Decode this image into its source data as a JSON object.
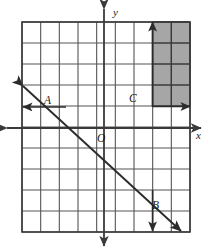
{
  "figure": {
    "background_color": "#ffffff",
    "width": 210,
    "height": 251
  },
  "grid": {
    "columns": 9,
    "rows": 10,
    "left": 22,
    "top": 22,
    "right": 190,
    "bottom": 232,
    "cell_width": 18.67,
    "cell_height": 21,
    "line_color": "#555555",
    "line_width": 1.1,
    "border_color": "#3a3a3a",
    "border_width": 1.6
  },
  "axes": {
    "color": "#3a3a3a",
    "width": 1.8,
    "x_axis": {
      "label": "x",
      "label_x": 196,
      "label_y": 139,
      "y": 128,
      "from_x": 7,
      "to_x": 201,
      "arrow_start": true,
      "arrow_end": true
    },
    "y_axis": {
      "label": "y",
      "label_x": 113,
      "label_y": 16,
      "x": 104,
      "from_y": 9,
      "to_y": 246,
      "arrow_start": true,
      "arrow_end": true
    },
    "origin": {
      "label": "O",
      "label_x": 97,
      "label_y": 142,
      "x": 104,
      "y": 128
    }
  },
  "line": {
    "name": "line-AB",
    "color": "#2b2b2b",
    "width": 1.9,
    "x1": 23,
    "y1": 86,
    "x2": 181,
    "y2": 231,
    "arrow_start": true,
    "arrow_end": true
  },
  "points": [
    {
      "label": "A",
      "label_x": 44,
      "label_y": 104,
      "x": 41,
      "y": 107
    },
    {
      "label": "C",
      "label_x": 129,
      "label_y": 102,
      "x": 133,
      "y": 107
    },
    {
      "label": "B",
      "label_x": 152,
      "label_y": 209,
      "x": 152,
      "y": 212
    }
  ],
  "shaded_region": {
    "name": "shaded-rectangle",
    "fill_color": "#a6a6a6",
    "stroke_color": "#3a3a3a",
    "stroke_width": 1.5,
    "x": 152.6,
    "y": 22,
    "width": 37.4,
    "height": 84,
    "columns": 2,
    "rows": 4,
    "description": "2 by 4 block of grid cells shaded gray in the upper right"
  },
  "measure_arrows": [
    {
      "name": "arrow-A-left",
      "orientation": "horizontal",
      "x1": 66,
      "y1": 107,
      "x2": 23,
      "y2": 107,
      "arrow_end": true,
      "color": "#2b2b2b"
    },
    {
      "name": "arrow-C-up",
      "orientation": "vertical",
      "x1": 152.6,
      "y1": 107,
      "x2": 152.6,
      "y2": 22,
      "arrow_end": true,
      "color": "#2b2b2b"
    },
    {
      "name": "arrow-C-right",
      "orientation": "horizontal",
      "x1": 152.6,
      "y1": 106.5,
      "x2": 190,
      "y2": 106.5,
      "arrow_end": true,
      "color": "#2b2b2b"
    },
    {
      "name": "arrow-B-down",
      "orientation": "vertical",
      "x1": 152.6,
      "y1": 190,
      "x2": 152.6,
      "y2": 231,
      "arrow_end": true,
      "color": "#2b2b2b"
    }
  ]
}
